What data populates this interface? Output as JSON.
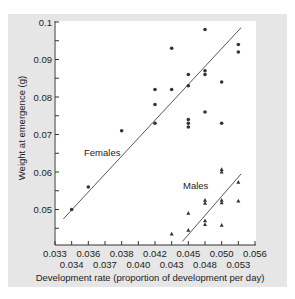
{
  "chart_data": {
    "type": "scatter",
    "title": "",
    "xlabel": "Development rate (proportion of development per day)",
    "ylabel": "Weight at emergence (g)",
    "x_tick_labels_upper": [
      "0.033",
      "0.036",
      "0.038",
      "0.042",
      "0.045",
      "0.050",
      "0.056"
    ],
    "x_tick_labels_lower": [
      "0.034",
      "0.037",
      "0.040",
      "0.043",
      "0.048",
      "0.053"
    ],
    "x_ticks": [
      "0.033",
      "0.034",
      "0.036",
      "0.037",
      "0.038",
      "0.040",
      "0.042",
      "0.043",
      "0.045",
      "0.048",
      "0.050",
      "0.053",
      "0.056"
    ],
    "y_ticks": [
      "0.1",
      "0.09",
      "0.08",
      "0.07",
      "0.06",
      "0.05"
    ],
    "ylim": [
      0.0405,
      0.1
    ],
    "xlim": [
      0.033,
      0.056
    ],
    "grid": false,
    "legend": "inline labels",
    "series": [
      {
        "name": "Females",
        "marker": "circle",
        "color": "#333333",
        "points": [
          {
            "x": 0.034,
            "y": 0.05
          },
          {
            "x": 0.036,
            "y": 0.056
          },
          {
            "x": 0.038,
            "y": 0.071
          },
          {
            "x": 0.042,
            "y": 0.073
          },
          {
            "x": 0.042,
            "y": 0.078
          },
          {
            "x": 0.042,
            "y": 0.082
          },
          {
            "x": 0.043,
            "y": 0.093
          },
          {
            "x": 0.043,
            "y": 0.082
          },
          {
            "x": 0.045,
            "y": 0.086
          },
          {
            "x": 0.045,
            "y": 0.083
          },
          {
            "x": 0.045,
            "y": 0.074
          },
          {
            "x": 0.045,
            "y": 0.073
          },
          {
            "x": 0.045,
            "y": 0.072
          },
          {
            "x": 0.048,
            "y": 0.098
          },
          {
            "x": 0.048,
            "y": 0.087
          },
          {
            "x": 0.048,
            "y": 0.086
          },
          {
            "x": 0.048,
            "y": 0.076
          },
          {
            "x": 0.05,
            "y": 0.084
          },
          {
            "x": 0.05,
            "y": 0.073
          },
          {
            "x": 0.053,
            "y": 0.094
          },
          {
            "x": 0.053,
            "y": 0.092
          }
        ],
        "regression_line": {
          "x_start": 0.0335,
          "y_start": 0.0475,
          "x_end": 0.0535,
          "y_end": 0.0985
        }
      },
      {
        "name": "Males",
        "marker": "triangle",
        "color": "#333333",
        "points": [
          {
            "x": 0.043,
            "y": 0.0435
          },
          {
            "x": 0.045,
            "y": 0.0445
          },
          {
            "x": 0.045,
            "y": 0.049
          },
          {
            "x": 0.048,
            "y": 0.0525
          },
          {
            "x": 0.048,
            "y": 0.0517
          },
          {
            "x": 0.048,
            "y": 0.047
          },
          {
            "x": 0.048,
            "y": 0.046
          },
          {
            "x": 0.05,
            "y": 0.0607
          },
          {
            "x": 0.05,
            "y": 0.06
          },
          {
            "x": 0.05,
            "y": 0.0525
          },
          {
            "x": 0.05,
            "y": 0.0518
          },
          {
            "x": 0.05,
            "y": 0.0458
          },
          {
            "x": 0.053,
            "y": 0.0573
          },
          {
            "x": 0.053,
            "y": 0.0523
          }
        ],
        "regression_line": {
          "x_start": 0.0443,
          "y_start": 0.0415,
          "x_end": 0.0535,
          "y_end": 0.0595
        }
      }
    ]
  },
  "labels": {
    "females": "Females",
    "males": "Males"
  },
  "colors": {
    "panel_background": "#e6e6e6",
    "plot_background": "#ffffff",
    "ink": "#333333"
  }
}
